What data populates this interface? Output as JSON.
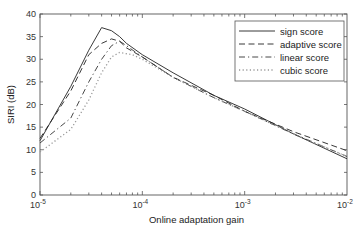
{
  "chart_data": {
    "type": "line",
    "title": "",
    "xlabel": "Online adaptation gain",
    "ylabel": "SIRI (dB)",
    "xscale": "log",
    "xlim": [
      1e-05,
      0.01
    ],
    "ylim": [
      0,
      40
    ],
    "x_ticks": [
      {
        "value": 1e-05,
        "base": "10",
        "exp": "-5"
      },
      {
        "value": 0.0001,
        "base": "10",
        "exp": "-4"
      },
      {
        "value": 0.001,
        "base": "10",
        "exp": "-3"
      },
      {
        "value": 0.01,
        "base": "10",
        "exp": "-2"
      }
    ],
    "y_ticks": [
      0,
      5,
      10,
      15,
      20,
      25,
      30,
      35,
      40
    ],
    "grid": false,
    "legend": {
      "position": "top-right"
    },
    "series": [
      {
        "name": "sign score",
        "style": "solid",
        "color": "#222222",
        "x": [
          1e-05,
          2e-05,
          3e-05,
          4e-05,
          5e-05,
          6e-05,
          7e-05,
          0.0001,
          0.0002,
          0.0005,
          0.001,
          0.003,
          0.01
        ],
        "y": [
          12,
          24,
          32,
          37,
          36.3,
          35,
          33.5,
          31,
          27,
          22,
          19,
          13.5,
          8
        ]
      },
      {
        "name": "adaptive score",
        "style": "dashed",
        "color": "#222222",
        "x": [
          1e-05,
          2e-05,
          3e-05,
          4e-05,
          5e-05,
          6e-05,
          7e-05,
          0.0001,
          0.0002,
          0.0005,
          0.001,
          0.003,
          0.01
        ],
        "y": [
          12.5,
          23,
          31,
          33.5,
          34.5,
          34,
          32.5,
          30.5,
          26,
          22,
          18.5,
          14,
          9.8
        ]
      },
      {
        "name": "linear score",
        "style": "dashdot",
        "color": "#333333",
        "x": [
          1e-05,
          2e-05,
          3e-05,
          4e-05,
          5e-05,
          6e-05,
          7e-05,
          0.0001,
          0.0002,
          0.0005,
          0.001,
          0.003,
          0.01
        ],
        "y": [
          11.5,
          17,
          25,
          30,
          33,
          34,
          33,
          30.5,
          26,
          21.5,
          18.5,
          13.5,
          8.5
        ]
      },
      {
        "name": "cubic score",
        "style": "dotted",
        "color": "#999999",
        "x": [
          1e-05,
          2e-05,
          3e-05,
          4e-05,
          5e-05,
          6e-05,
          8e-05,
          0.0001,
          0.0002,
          0.0005,
          0.001,
          0.003,
          0.01
        ],
        "y": [
          9.5,
          14.5,
          21,
          27,
          30.5,
          31.5,
          31,
          30,
          26,
          21.5,
          18.5,
          13.5,
          8.5
        ]
      }
    ]
  }
}
